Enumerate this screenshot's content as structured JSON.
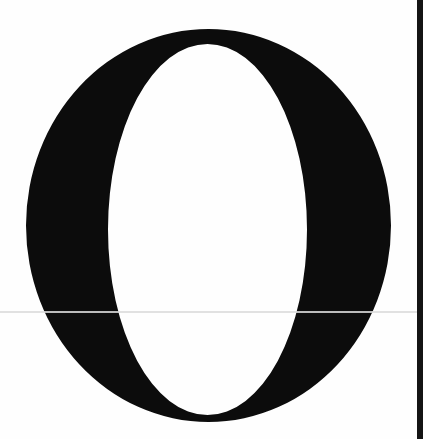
{
  "page": {
    "background_color": "#fefefe"
  },
  "initial_letter": {
    "character": "O",
    "color": "#0c0c0c",
    "outer": {
      "cx": 208.5,
      "cy": 225.5,
      "rx": 182.5,
      "ry": 196.5
    },
    "inner": {
      "cx": 207.5,
      "cy": 229.5,
      "rx": 99.5,
      "ry": 185.5
    }
  },
  "scan_line": {
    "y": 311,
    "color": "#dcdcdc"
  },
  "edge_bar": {
    "x": 417,
    "width": 6,
    "color": "#141414"
  }
}
